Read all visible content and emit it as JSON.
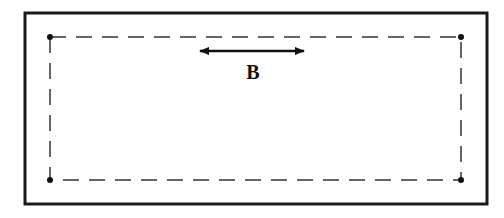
{
  "diagram": {
    "label": "B",
    "colors": {
      "stroke": "#1a1a1a",
      "dash": "#333333",
      "background": "#ffffff"
    },
    "outer_frame": {
      "x": 25,
      "y": 13,
      "width": 462,
      "height": 191
    },
    "inner_dashed_rect": {
      "x": 50,
      "y": 37,
      "width": 411,
      "height": 143
    },
    "corner_dots": [
      {
        "x": 50,
        "y": 37
      },
      {
        "x": 461,
        "y": 37
      },
      {
        "x": 50,
        "y": 180
      },
      {
        "x": 461,
        "y": 180
      }
    ],
    "arrow": {
      "x1": 198,
      "y1": 51,
      "x2": 306,
      "y2": 51,
      "type": "double-headed"
    }
  }
}
